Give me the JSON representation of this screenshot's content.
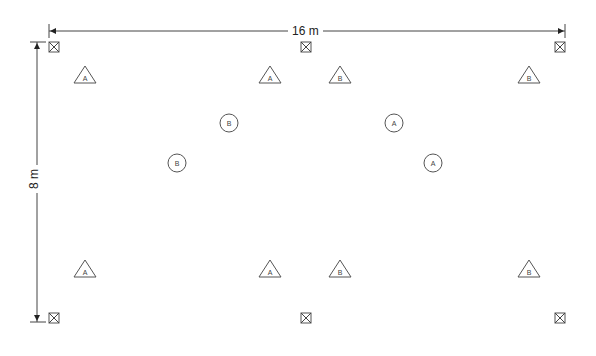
{
  "diagram": {
    "type": "floor-layout-plan",
    "dimensions": {
      "width_label": "16 m",
      "height_label": "8 m"
    },
    "corner_markers": [
      {
        "id": "m1",
        "x": 54,
        "y": 47
      },
      {
        "id": "m2",
        "x": 306,
        "y": 47
      },
      {
        "id": "m3",
        "x": 560,
        "y": 47
      },
      {
        "id": "m4",
        "x": 54,
        "y": 318
      },
      {
        "id": "m5",
        "x": 306,
        "y": 318
      },
      {
        "id": "m6",
        "x": 560,
        "y": 318
      }
    ],
    "triangles": [
      {
        "label": "A",
        "x": 85,
        "y": 76
      },
      {
        "label": "A",
        "x": 270,
        "y": 76
      },
      {
        "label": "B",
        "x": 340,
        "y": 76
      },
      {
        "label": "B",
        "x": 529,
        "y": 76
      },
      {
        "label": "A",
        "x": 85,
        "y": 270
      },
      {
        "label": "A",
        "x": 270,
        "y": 270
      },
      {
        "label": "B",
        "x": 340,
        "y": 270
      },
      {
        "label": "B",
        "x": 529,
        "y": 270
      }
    ],
    "circles": [
      {
        "label": "B",
        "x": 229,
        "y": 123
      },
      {
        "label": "B",
        "x": 177,
        "y": 163
      },
      {
        "label": "A",
        "x": 394,
        "y": 123
      },
      {
        "label": "A",
        "x": 433,
        "y": 163
      }
    ],
    "colors": {
      "stroke": "#444444",
      "background": "#ffffff"
    }
  }
}
